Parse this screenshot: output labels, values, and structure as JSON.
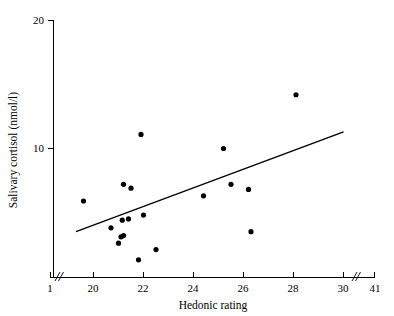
{
  "chart_data": {
    "type": "scatter",
    "title": "",
    "xlabel": "Hedonic rating",
    "ylabel": "Salivary cortisol (nmol/l)",
    "xlim": [
      19,
      30
    ],
    "ylim": [
      1,
      20
    ],
    "grid": false,
    "legend": "none",
    "axis_breaks": {
      "x_left": {
        "label_outer": "1",
        "label_inner": "20"
      },
      "x_right": {
        "label_inner": "30",
        "label_outer": "41"
      }
    },
    "xticks": [
      1,
      20,
      22,
      24,
      26,
      28,
      30,
      41
    ],
    "xtick_labels": [
      "1",
      "20",
      "22",
      "24",
      "26",
      "28",
      "30",
      "41"
    ],
    "yticks": [
      10,
      20
    ],
    "ytick_labels": [
      "10",
      "20"
    ],
    "points": [
      {
        "x": 19.6,
        "y": 5.9
      },
      {
        "x": 20.7,
        "y": 3.8
      },
      {
        "x": 21.0,
        "y": 2.6
      },
      {
        "x": 21.1,
        "y": 3.1
      },
      {
        "x": 21.2,
        "y": 3.2
      },
      {
        "x": 21.15,
        "y": 4.4
      },
      {
        "x": 21.2,
        "y": 7.2
      },
      {
        "x": 21.4,
        "y": 4.5
      },
      {
        "x": 21.5,
        "y": 6.9
      },
      {
        "x": 21.8,
        "y": 1.3
      },
      {
        "x": 21.9,
        "y": 11.1
      },
      {
        "x": 22.0,
        "y": 4.8
      },
      {
        "x": 22.5,
        "y": 2.1
      },
      {
        "x": 24.4,
        "y": 6.3
      },
      {
        "x": 25.2,
        "y": 10.0
      },
      {
        "x": 25.5,
        "y": 7.2
      },
      {
        "x": 26.2,
        "y": 6.8
      },
      {
        "x": 26.3,
        "y": 3.5
      },
      {
        "x": 28.1,
        "y": 14.2
      }
    ],
    "fit_line": {
      "x_start": 19.3,
      "y_start": 3.5,
      "x_end": 30.0,
      "y_end": 11.3
    },
    "point_color": "#000000",
    "line_color": "#000000",
    "axis_color": "#000000",
    "background_color": "#ffffff"
  },
  "labels": {
    "x_axis_title": "Hedonic rating",
    "y_axis_title": "Salivary cortisol (nmol/l)",
    "x_tick_1": "1",
    "x_tick_20": "20",
    "x_tick_22": "22",
    "x_tick_24": "24",
    "x_tick_26": "26",
    "x_tick_28": "28",
    "x_tick_30": "30",
    "x_tick_41": "41",
    "y_tick_10": "10",
    "y_tick_20": "20"
  }
}
